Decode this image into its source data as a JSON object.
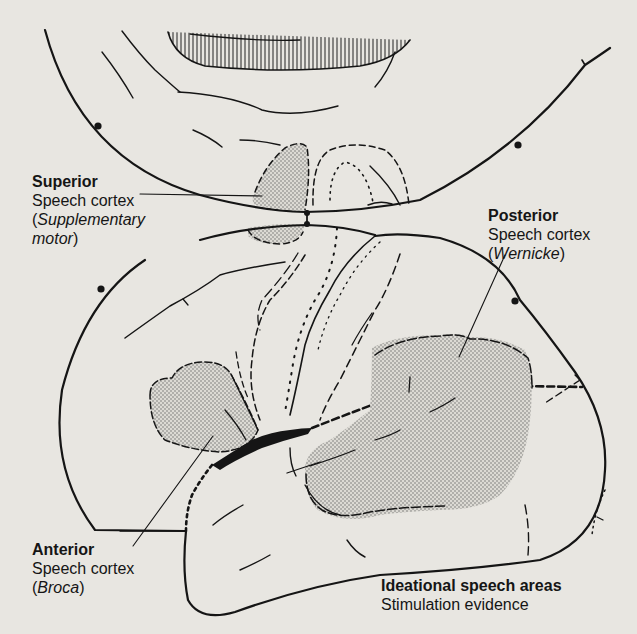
{
  "figure": {
    "type": "brain speech cortex diagram",
    "colors": {
      "background": "#e8e6e1",
      "ink": "#151515",
      "stipple": "#777777"
    }
  },
  "labels": {
    "superior": {
      "title": "Superior",
      "line1": "Speech cortex",
      "paren_open": "(",
      "italic": "Supplementary",
      "line3_italic": "motor",
      "paren_close": ")"
    },
    "posterior": {
      "title": "Posterior",
      "line1": "Speech cortex",
      "paren_open": "(",
      "italic": "Wernicke",
      "paren_close": ")"
    },
    "anterior": {
      "title": "Anterior",
      "line1": "Speech cortex",
      "paren_open": "(",
      "italic": "Broca",
      "paren_close": ")"
    },
    "ideational": {
      "title": "Ideational speech areas",
      "line1": "Stimulation evidence"
    }
  }
}
